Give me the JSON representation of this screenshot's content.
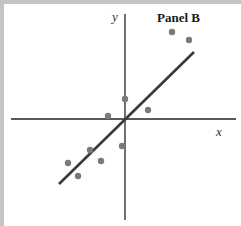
{
  "chart_data": {
    "type": "scatter",
    "title": "Panel B",
    "xlabel": "x",
    "ylabel": "y",
    "grid": false,
    "legend": null,
    "axes_cross_at_origin": true,
    "xlim": [
      -5.7,
      5.5
    ],
    "ylim": [
      -5.0,
      5.3
    ],
    "points": [
      {
        "x": 2.35,
        "y": 4.35
      },
      {
        "x": 3.2,
        "y": 3.95
      },
      {
        "x": 0.0,
        "y": 1.0
      },
      {
        "x": 1.15,
        "y": 0.45
      },
      {
        "x": -0.85,
        "y": 0.15
      },
      {
        "x": -0.15,
        "y": -1.35
      },
      {
        "x": -1.75,
        "y": -1.55
      },
      {
        "x": -1.2,
        "y": -2.1
      },
      {
        "x": -2.85,
        "y": -2.2
      },
      {
        "x": -2.35,
        "y": -2.85
      }
    ],
    "fit_line": {
      "x_start": -3.3,
      "y_start": -3.25,
      "x_end": 3.45,
      "y_end": 3.35,
      "slope": 0.98,
      "intercept": 0.0
    },
    "colors": {
      "points": "#7a7a7a",
      "fit_line": "#3a3a3a",
      "axes": "#222222",
      "frame_border": "#c4c4c4"
    }
  },
  "labels": {
    "panel_title": "Panel B",
    "x_axis": "x",
    "y_axis": "y"
  }
}
